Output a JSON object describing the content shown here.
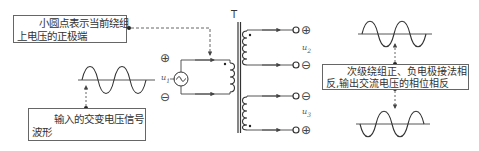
{
  "annotations": {
    "dot_note": {
      "line1": "小圆点表示当前绕组",
      "line2": "上电压的正极端"
    },
    "input_note": {
      "line1": "输入的交变电压信号",
      "line2": "波形"
    },
    "output_note": {
      "line1": "次级绕组正、负电极接法相",
      "line2": "反,输出交流电压的相位相反"
    }
  },
  "transformer": {
    "label": "T"
  },
  "voltages": {
    "u1": {
      "base": "u",
      "sub": "1"
    },
    "u2": {
      "base": "u",
      "sub": "2"
    },
    "u3": {
      "base": "u",
      "sub": "3"
    }
  },
  "polarity": {
    "primary_top": "⊕",
    "primary_bottom": "⊖",
    "sec1_top": "⊕",
    "sec1_bottom": "⊖",
    "sec2_top": "⊖",
    "sec2_bottom": "⊕"
  },
  "icons": {
    "ac_source": "~"
  },
  "colors": {
    "line": "#444444",
    "box_border": "#666666",
    "text": "#333333"
  }
}
